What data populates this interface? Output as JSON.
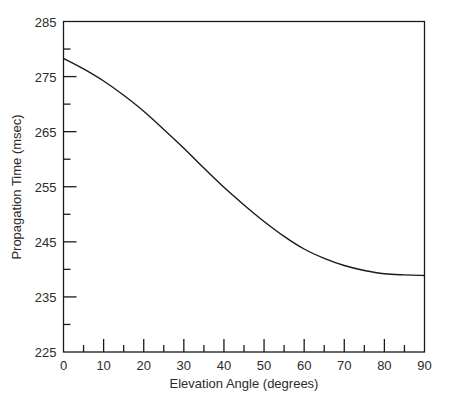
{
  "chart_data": {
    "type": "line",
    "title": "",
    "subtitle": "",
    "xlabel": "Elevation Angle (degrees)",
    "ylabel": "Propagation Time (msec)",
    "xlim": [
      0,
      90
    ],
    "ylim": [
      225,
      285
    ],
    "x_major_ticks": [
      0,
      10,
      20,
      30,
      40,
      50,
      60,
      70,
      80,
      90
    ],
    "x_minor_ticks": [
      5,
      15,
      25,
      35,
      45,
      55,
      65,
      75,
      85
    ],
    "y_major_ticks": [
      225,
      235,
      245,
      255,
      265,
      275,
      285
    ],
    "y_minor_ticks": [
      230,
      240,
      250,
      260,
      270,
      280
    ],
    "x_tick_labels": [
      "0",
      "10",
      "20",
      "30",
      "40",
      "50",
      "60",
      "70",
      "80",
      "90"
    ],
    "y_tick_labels": [
      "225",
      "235",
      "245",
      "255",
      "265",
      "275",
      "285"
    ],
    "grid": false,
    "legend": false,
    "legend_position": "none",
    "line_color": "#1a1a1a",
    "line_width": 1.4,
    "background_color": "#ffffff",
    "axis_color": "#1a1a1a",
    "series": [
      {
        "name": "Propagation Time",
        "x": [
          0,
          5,
          10,
          15,
          20,
          25,
          30,
          35,
          40,
          45,
          50,
          55,
          60,
          65,
          70,
          75,
          80,
          85,
          90
        ],
        "values": [
          278.3,
          276.4,
          274.2,
          271.6,
          268.7,
          265.4,
          262.0,
          258.4,
          254.9,
          251.7,
          248.7,
          246.0,
          243.7,
          242.0,
          240.7,
          239.8,
          239.2,
          239.0,
          238.9
        ]
      }
    ]
  }
}
